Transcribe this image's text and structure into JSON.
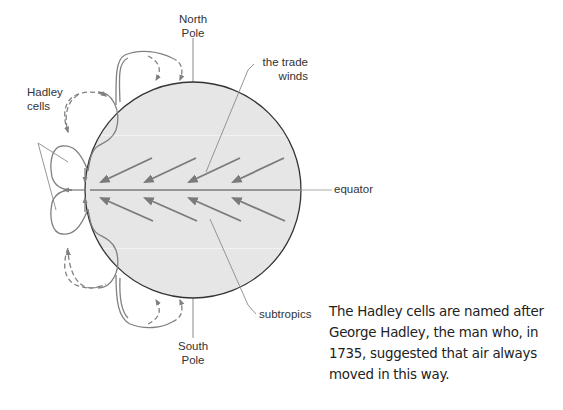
{
  "diagram": {
    "labels": {
      "north_pole": "North\nPole",
      "south_pole": "South\nPole",
      "trade_winds": "the trade\nwinds",
      "equator": "equator",
      "subtropics": "subtropics",
      "hadley_cells": "Hadley\ncells"
    },
    "colors": {
      "globe_fill": "#e6e6e6",
      "globe_outline": "#333333",
      "arrow": "#7a7a7a",
      "cell_line": "#808080",
      "leader_line": "#8a8a8a",
      "text": "#333333"
    },
    "globe": {
      "cx": 193,
      "cy": 190,
      "r": 108
    },
    "wind_arrows": {
      "northern_hemisphere_direction": "toward south-west (toward equator)",
      "southern_hemisphere_direction": "toward north-west (toward equator)",
      "count_per_hemisphere": 4
    }
  },
  "caption": {
    "text": "The Hadley cells are named after\nGeorge Hadley, the man who, in\n1735, suggested that air always\nmoved in this way."
  }
}
